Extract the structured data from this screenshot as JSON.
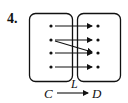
{
  "problem": {
    "number": "4.",
    "domain_set": "C",
    "codomain_set": "D",
    "map_label": "L"
  },
  "diagram": {
    "left_points": 4,
    "right_points": 4,
    "arrows": [
      {
        "from": 1,
        "to": 1
      },
      {
        "from": 2,
        "to": 2
      },
      {
        "from": 2,
        "to": 3
      },
      {
        "from": 3,
        "to": 3
      },
      {
        "from": 4,
        "to": 4
      }
    ],
    "ink_color": "#111111"
  }
}
